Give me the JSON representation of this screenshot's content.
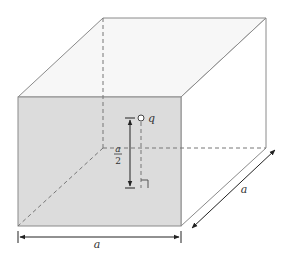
{
  "figure": {
    "type": "cube with point charge",
    "colors": {
      "front_face": "#dcdcdc",
      "top_face": "#f7f7f7",
      "edge": "#8a8a8a",
      "hidden_edge": "#777777",
      "dimension": "#222222"
    }
  },
  "labels": {
    "charge": "q",
    "width": "a",
    "depth": "a",
    "height_num": "a",
    "height_den": "2"
  }
}
